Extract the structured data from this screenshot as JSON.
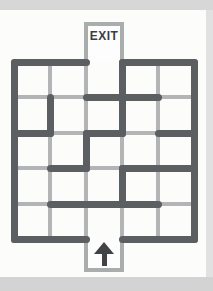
{
  "page": {
    "background": "#fcfcfb",
    "edge_strip_top_color": "#d6d7d6",
    "edge_strip_bottom_color": "#d2d3d2",
    "edge_strip_right_color": "#e0e1e0"
  },
  "maze": {
    "columns": 5,
    "rows": 5,
    "x_lines": [
      14,
      50,
      86,
      122,
      158,
      194
    ],
    "y_lines": [
      62,
      97,
      133,
      168,
      204,
      239
    ],
    "wall_color": "#5b5f62",
    "grid_color": "#b2b4b5",
    "box_border_color": "#aaadae",
    "wall_thickness": 7,
    "grid_thickness": 4,
    "gray_v": [
      1,
      2,
      3,
      4
    ],
    "gray_h": [
      1,
      2,
      3,
      4
    ],
    "dark_h": [
      [
        0,
        0,
        2
      ],
      [
        0,
        3,
        5
      ],
      [
        1,
        2,
        4
      ],
      [
        2,
        0,
        1
      ],
      [
        2,
        2,
        3
      ],
      [
        2,
        4,
        5
      ],
      [
        3,
        1,
        2
      ],
      [
        3,
        3,
        5
      ],
      [
        4,
        1,
        4
      ],
      [
        5,
        0,
        2
      ],
      [
        5,
        3,
        5
      ]
    ],
    "dark_v": [
      [
        0,
        0,
        5
      ],
      [
        5,
        0,
        5
      ],
      [
        1,
        1,
        2
      ],
      [
        2,
        2,
        3
      ],
      [
        3,
        0,
        2
      ],
      [
        3,
        3,
        4
      ]
    ],
    "exit": {
      "label": "EXIT",
      "column": 2,
      "box_top": 22,
      "text_color": "#3a3e41"
    },
    "entrance": {
      "column": 2,
      "box_bottom": 272,
      "arrow_icon": "up-arrow",
      "arrow_color": "#404447"
    }
  }
}
